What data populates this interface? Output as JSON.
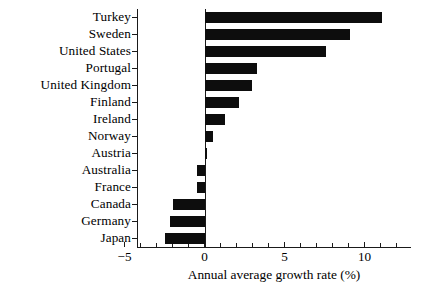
{
  "chart_data": {
    "type": "bar",
    "orientation": "horizontal",
    "title": "",
    "subtitle": "",
    "xlabel": "Annual average growth rate (%)",
    "ylabel": "",
    "xlim": [
      -4.25,
      12.85
    ],
    "ylim": [
      0,
      14
    ],
    "grid": false,
    "legend": null,
    "xticks_major": [
      -5,
      0,
      5,
      10
    ],
    "xticklabels": [
      "−5",
      "0",
      "5",
      "10"
    ],
    "xticks_minor": [
      -4,
      -3,
      -2,
      -1,
      1,
      2,
      3,
      4,
      6,
      7,
      8,
      9,
      11,
      12
    ],
    "zero_reference_line": 0,
    "categories": [
      "Turkey",
      "Sweden",
      "United States",
      "Portugal",
      "United Kingdom",
      "Finland",
      "Ireland",
      "Norway",
      "Austria",
      "Australia",
      "France",
      "Canada",
      "Germany",
      "Japan"
    ],
    "values": [
      11.1,
      9.1,
      7.6,
      3.3,
      2.95,
      2.15,
      1.25,
      0.55,
      0.15,
      -0.45,
      -0.5,
      -1.95,
      -2.15,
      -2.5
    ],
    "bar_color": "#0d0d0d"
  }
}
